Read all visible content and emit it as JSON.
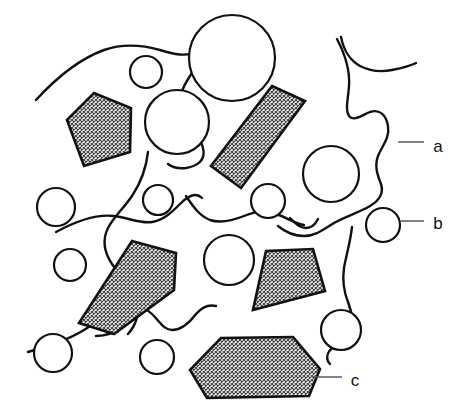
{
  "figure": {
    "background_color": "#ffffff",
    "line_color": "#111111",
    "leader_color": "#5a5a5a",
    "hatch_fill_color": "#d9d9d9",
    "width": 469,
    "height": 412
  },
  "callouts": [
    {
      "id": "a",
      "label": "a",
      "points_to": "matrix-boundary-curve",
      "text_x": 438,
      "text_y": 148,
      "leader_x1": 398,
      "leader_y1": 142,
      "leader_x2": 424,
      "leader_y2": 142
    },
    {
      "id": "b",
      "label": "b",
      "points_to": "pore-circle",
      "text_x": 438,
      "text_y": 225,
      "leader_x1": 401,
      "leader_y1": 221,
      "leader_x2": 424,
      "leader_y2": 221
    },
    {
      "id": "c",
      "label": "c",
      "points_to": "filler-particle",
      "text_x": 355,
      "text_y": 382,
      "leader_x1": 312,
      "leader_y1": 377,
      "leader_x2": 342,
      "leader_y2": 377
    }
  ],
  "particles": [
    {
      "name": "particle-upper-left",
      "points": "67,120 94,93 131,108 130,152 84,166"
    },
    {
      "name": "particle-upper-right-bar",
      "points": "272,86 305,101 241,188 211,166"
    },
    {
      "name": "particle-mid-left",
      "points": "132,241 176,253 174,290 114,334 79,323"
    },
    {
      "name": "particle-mid-right",
      "points": "266,251 313,249 325,291 253,310"
    },
    {
      "name": "particle-bottom-center",
      "points": "221,338 293,337 320,369 309,396 207,398 190,370"
    }
  ],
  "pores": [
    {
      "name": "pore-top-small",
      "cx": 146,
      "cy": 72,
      "r": 16
    },
    {
      "name": "pore-top-large",
      "cx": 232,
      "cy": 58,
      "r": 43
    },
    {
      "name": "pore-upper-mid",
      "cx": 177,
      "cy": 122,
      "r": 32
    },
    {
      "name": "pore-left-upper",
      "cx": 56,
      "cy": 207,
      "r": 19
    },
    {
      "name": "pore-center-small",
      "cx": 158,
      "cy": 200,
      "r": 15
    },
    {
      "name": "pore-center-right-small",
      "cx": 268,
      "cy": 201,
      "r": 17
    },
    {
      "name": "pore-right-large",
      "cx": 331,
      "cy": 174,
      "r": 28
    },
    {
      "name": "pore-labeled-b",
      "cx": 383,
      "cy": 225,
      "r": 17
    },
    {
      "name": "pore-left-mid",
      "cx": 70,
      "cy": 265,
      "r": 16
    },
    {
      "name": "pore-center",
      "cx": 229,
      "cy": 260,
      "r": 25
    },
    {
      "name": "pore-right-lower",
      "cx": 341,
      "cy": 330,
      "r": 20
    },
    {
      "name": "pore-bottom-left",
      "cx": 53,
      "cy": 353,
      "r": 19
    },
    {
      "name": "pore-bottom-mid",
      "cx": 157,
      "cy": 357,
      "r": 17
    }
  ],
  "matrix_curves": [
    {
      "name": "matrix-curve-top-left",
      "d": "M36,100 C58,76 82,58 104,50 C124,43 146,46 160,50 C176,55 184,56 196,53"
    },
    {
      "name": "matrix-curve-top-center",
      "d": "M199,41 C201,58 196,66 190,76 C182,88 178,98 182,110 C188,124 200,134 203,148 C206,160 198,166 186,168 C178,169 172,167 168,164"
    },
    {
      "name": "matrix-curve-top-right",
      "d": "M341,37 C344,52 350,60 360,66 C372,72 382,72 392,70 C402,68 410,66 416,63"
    },
    {
      "name": "matrix-curve-a-boundary",
      "d": "M337,39 C347,58 350,72 349,86 C348,100 345,110 349,116 C354,122 362,115 370,112 C379,109 386,114 388,126 C390,138 382,146 378,156 C374,167 378,176 381,184 C384,193 380,200 370,206 C358,213 344,217 334,223 C324,229 316,236 304,236 C293,236 284,231 278,226"
    },
    {
      "name": "matrix-curve-mid-left",
      "d": "M148,152 C146,170 140,184 132,196 C123,209 113,218 108,228 C102,240 104,252 112,264 C122,278 132,288 136,300 C140,313 136,325 128,334"
    },
    {
      "name": "matrix-curve-center-wave",
      "d": "M56,232 C78,220 98,214 114,216 C130,218 140,224 152,222 C164,220 172,212 180,204 C188,196 196,192 202,198"
    },
    {
      "name": "matrix-curve-mid-wave",
      "d": "M186,196 C194,208 200,216 210,220 C222,224 234,220 244,216 C256,211 266,210 276,214 C288,218 296,224 304,225"
    },
    {
      "name": "matrix-curve-mid-hook",
      "d": "M290,218 C296,224 300,228 306,228 C312,228 316,223 318,219"
    },
    {
      "name": "matrix-curve-lower-left",
      "d": "M28,352 C48,346 68,340 84,330 C98,321 108,312 120,308 C134,303 144,306 152,314 C160,322 164,330 172,330 C182,330 190,322 196,314 C202,307 208,304 216,306"
    },
    {
      "name": "matrix-curve-bottom-right",
      "d": "M352,227 C350,244 346,256 344,268 C342,282 344,292 348,302 C352,313 354,322 350,330 C346,338 338,342 332,348 C326,354 326,360 330,364"
    },
    {
      "name": "matrix-curve-bottom-left-tail",
      "d": "M96,336 C108,336 116,332 124,326"
    }
  ]
}
